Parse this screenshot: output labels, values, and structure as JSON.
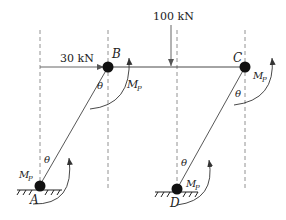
{
  "diagram": {
    "loads": {
      "horizontal": {
        "value": "30",
        "unit": "kN",
        "label": "30 kN"
      },
      "vertical": {
        "value": "100",
        "unit": "kN",
        "label": "100 kN"
      }
    },
    "nodes": [
      {
        "id": "A",
        "label": "A",
        "type": "fixed-support"
      },
      {
        "id": "B",
        "label": "B",
        "type": "plastic-hinge"
      },
      {
        "id": "C",
        "label": "C",
        "type": "plastic-hinge"
      },
      {
        "id": "D",
        "label": "D",
        "type": "fixed-support"
      }
    ],
    "hinge_moment": {
      "symbol": "M",
      "subscript": "P"
    },
    "rotation_symbol": "θ",
    "colors": {
      "line": "#333333",
      "dashed": "#666666",
      "node": "#111111"
    }
  }
}
